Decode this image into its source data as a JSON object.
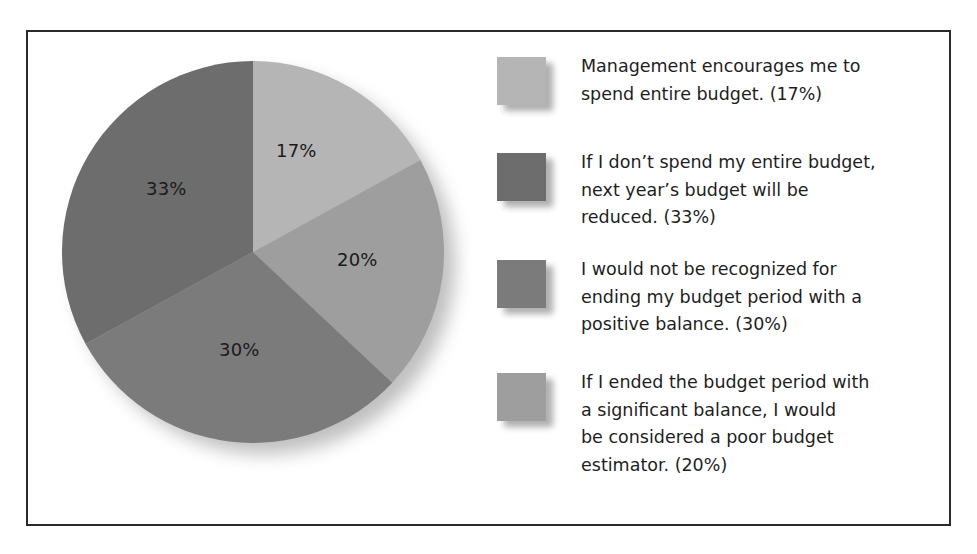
{
  "chart_data": {
    "type": "pie",
    "title": "",
    "start_angle_deg": 0,
    "direction": "clockwise",
    "slices": [
      {
        "label": "Management encourages me to spend entire budget. (17%)",
        "value": 17,
        "display": "17%",
        "color": "#b5b5b5"
      },
      {
        "label": "I would not be recognized for ending my budget period with a positive balance. (30%)",
        "value": 20,
        "display": "20%",
        "color": "#9e9e9e"
      },
      {
        "label": "If I don’t spend my entire budget, next year’s budget will be reduced. (33%)",
        "value": 30,
        "display": "30%",
        "color": "#7b7b7b"
      },
      {
        "label": "If I don’t spend my entire budget, next year’s budget will be reduced. (33%)",
        "value": 33,
        "display": "33%",
        "color": "#6d6d6d"
      }
    ],
    "slice_order_clockwise_from_top": [
      "17%",
      "20%",
      "30%",
      "33%"
    ],
    "legend_position": "right",
    "grid": false
  },
  "pie": {
    "labels": {
      "s17": "17%",
      "s20": "20%",
      "s30": "30%",
      "s33": "33%"
    }
  },
  "legend": {
    "items": [
      {
        "text": "Management encourages me to spend entire budget. (17%)",
        "lines": [
          "Management encourages me to",
          "spend entire budget. (17%)"
        ],
        "color": "#b5b5b5"
      },
      {
        "text": "If I don’t spend my entire budget, next year’s budget will be reduced. (33%)",
        "lines": [
          "If I don’t spend my entire budget,",
          "next year’s budget will be",
          "reduced. (33%)"
        ],
        "color": "#6d6d6d"
      },
      {
        "text": "I would not be recognized for ending my budget period with a positive balance. (30%)",
        "lines": [
          "I would not be recognized for",
          "ending my budget period with a",
          "positive balance. (30%)"
        ],
        "color": "#7b7b7b"
      },
      {
        "text": "If I ended the budget period with a significant balance, I would be considered a poor budget estimator. (20%)",
        "lines": [
          "If I ended the budget period with",
          "a significant balance, I would",
          "be considered a poor budget",
          "estimator. (20%)"
        ],
        "color": "#9e9e9e"
      }
    ]
  }
}
